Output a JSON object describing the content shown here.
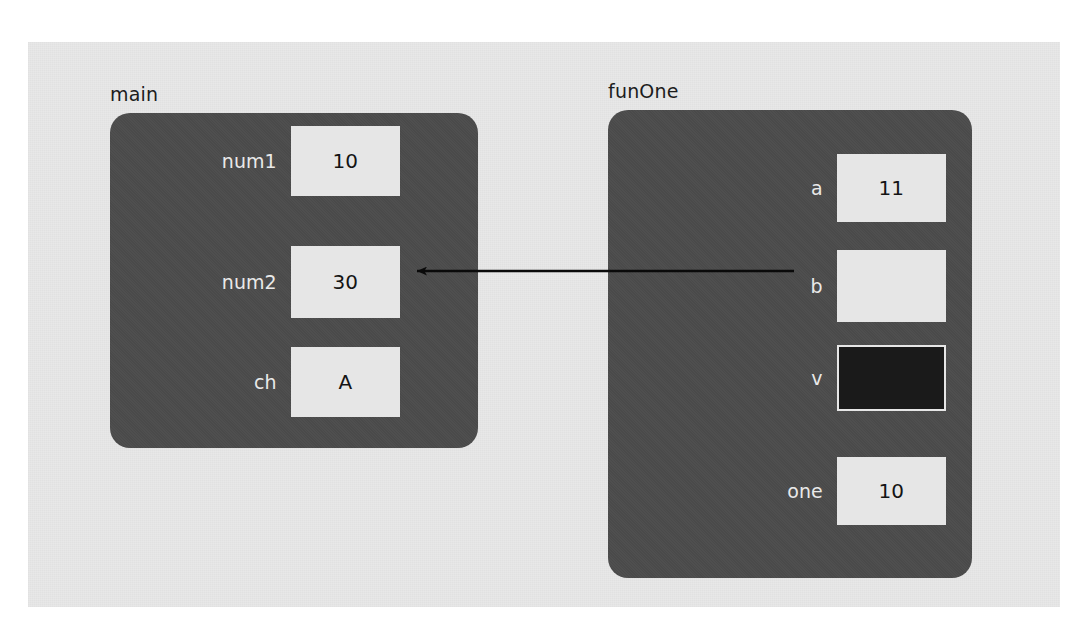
{
  "diagram": {
    "background_color": "#ffffff",
    "canvas_color": "#e8e8e8",
    "panel_color": "#4b4b4b",
    "box_color": "#e6e6e6",
    "dark_box_color": "#1a1a1a",
    "arrow_color": "#0a0a0a"
  },
  "frames": [
    {
      "label": "main",
      "variables": [
        {
          "name": "num1",
          "value": "10",
          "style": "light"
        },
        {
          "name": "num2",
          "value": "30",
          "style": "light"
        },
        {
          "name": "ch",
          "value": "A",
          "style": "light"
        }
      ]
    },
    {
      "label": "funOne",
      "variables": [
        {
          "name": "a",
          "value": "11",
          "style": "light"
        },
        {
          "name": "b",
          "value": "",
          "style": "light"
        },
        {
          "name": "v",
          "value": "",
          "style": "dark"
        },
        {
          "name": "one",
          "value": "10",
          "style": "light"
        }
      ]
    }
  ],
  "arrow": {
    "from": "funOne.b",
    "to": "main.num2",
    "direction": "left"
  }
}
